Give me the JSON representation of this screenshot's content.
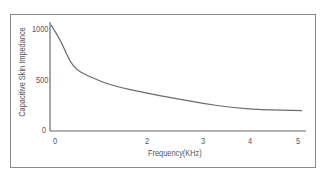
{
  "chart_data": {
    "type": "line",
    "title": "",
    "xlabel": "Frequency(KHz)",
    "ylabel": "Capacitive Skin Impedance",
    "xlim": [
      0,
      5
    ],
    "ylim": [
      0,
      1000
    ],
    "grid": false,
    "legend": null,
    "x_ticks": [
      {
        "label": "0",
        "px": 55
      },
      {
        "label": "2",
        "px": 147
      },
      {
        "label": "3",
        "px": 203
      },
      {
        "label": "4",
        "px": 250
      },
      {
        "label": "5",
        "px": 298
      }
    ],
    "y_ticks": [
      {
        "label": "1000",
        "py": 29
      },
      {
        "label": "500",
        "py": 80
      },
      {
        "label": "0",
        "py": 130
      }
    ],
    "series": [
      {
        "name": "Capacitive Skin Impedance",
        "x": [
          0.0,
          0.2,
          0.45,
          0.8,
          1.3,
          2.0,
          2.5,
          3.0,
          3.6,
          4.2,
          5.0
        ],
        "values": [
          1040,
          890,
          620,
          530,
          440,
          370,
          320,
          270,
          230,
          210,
          200
        ]
      }
    ]
  },
  "line_color": "#6b6b6b",
  "axis_color": "#6b6b6b"
}
